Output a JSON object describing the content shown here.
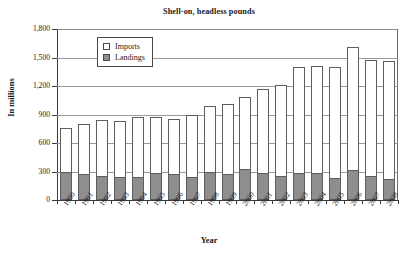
{
  "chart_data": {
    "type": "bar",
    "subtype": "stacked-vertical",
    "title": "Shell-on, headless pounds",
    "xlabel": "Year",
    "ylabel": "In millions",
    "categories": [
      "1990",
      "1991",
      "1992",
      "1993",
      "1994",
      "1995",
      "1996",
      "1997",
      "1998",
      "1999",
      "2000",
      "2001",
      "2002",
      "2003",
      "2004",
      "2005",
      "2006",
      "2007",
      "2008"
    ],
    "series": [
      {
        "name": "Landings",
        "color": "#8e8e8e",
        "values": [
          293,
          270,
          252,
          240,
          240,
          280,
          272,
          240,
          292,
          278,
          325,
          285,
          258,
          282,
          285,
          233,
          312,
          250,
          218
        ]
      },
      {
        "name": "Imports",
        "color": "#ffffff",
        "values": [
          467,
          535,
          588,
          595,
          630,
          590,
          578,
          655,
          695,
          730,
          755,
          880,
          952,
          1113,
          1130,
          1172,
          1298,
          1228,
          1242
        ]
      }
    ],
    "totals": [
      760,
      805,
      840,
      835,
      870,
      870,
      850,
      895,
      987,
      1008,
      1080,
      1165,
      1210,
      1395,
      1415,
      1405,
      1610,
      1478,
      1460
    ],
    "ylim": [
      0,
      1800
    ],
    "ytick_labels": [
      "1,800",
      "1,500",
      "1,200",
      "900",
      "600",
      "300",
      "0"
    ],
    "ytick_values": [
      1800,
      1500,
      1200,
      900,
      600,
      300,
      0
    ],
    "grid": true,
    "legend_position": "upper-left-inside",
    "legend_entries": [
      "Imports",
      "Landings"
    ]
  }
}
